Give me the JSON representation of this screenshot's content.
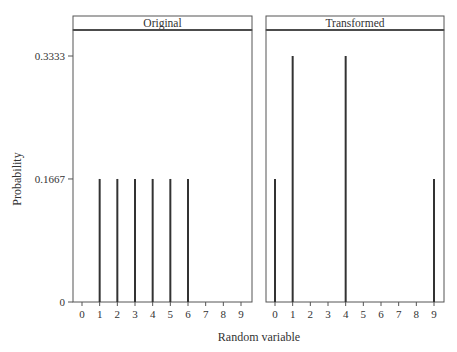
{
  "chart_data": [
    {
      "type": "bar",
      "style": "spike",
      "panel_title": "Original",
      "x": [
        0,
        1,
        2,
        3,
        4,
        5,
        6,
        7,
        8,
        9
      ],
      "values": [
        0,
        0.1667,
        0.1667,
        0.1667,
        0.1667,
        0.1667,
        0.1667,
        0,
        0,
        0
      ],
      "xlim": [
        0,
        9
      ],
      "ylim": [
        0,
        0.3333
      ]
    },
    {
      "type": "bar",
      "style": "spike",
      "panel_title": "Transformed",
      "x": [
        0,
        1,
        2,
        3,
        4,
        5,
        6,
        7,
        8,
        9
      ],
      "values": [
        0.1667,
        0.3333,
        0,
        0,
        0.3333,
        0,
        0,
        0,
        0,
        0.1667
      ],
      "xlim": [
        0,
        9
      ],
      "ylim": [
        0,
        0.3333
      ]
    }
  ],
  "shared": {
    "xlabel": "Random variable",
    "ylabel": "Probability",
    "xticks": [
      "0",
      "1",
      "2",
      "3",
      "4",
      "5",
      "6",
      "7",
      "8",
      "9"
    ],
    "yticks": [
      {
        "value": 0,
        "label": "0"
      },
      {
        "value": 0.1667,
        "label": "0.1667"
      },
      {
        "value": 0.3333,
        "label": "0.3333"
      }
    ],
    "line_color": "#333333",
    "frame_color": "#555555"
  }
}
